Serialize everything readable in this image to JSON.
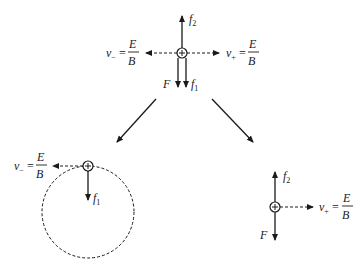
{
  "diagram": {
    "colors": {
      "stroke": "#1a1a1a",
      "background": "#ffffff"
    },
    "top": {
      "particle": {
        "symbol": "+",
        "x": 182,
        "y": 53
      },
      "labels": {
        "f2": "f",
        "f2_sub": "2",
        "f1": "f",
        "f1_sub": "1",
        "F": "F",
        "v_minus": "v",
        "v_minus_sub": "−",
        "v_plus": "v",
        "v_plus_sub": "+",
        "eq": "=",
        "num": "E",
        "den": "B"
      }
    },
    "bottom_left": {
      "particle": {
        "symbol": "+",
        "x": 88,
        "y": 166
      },
      "trajectory": "dashed circle",
      "labels": {
        "f1": "f",
        "f1_sub": "1",
        "v_minus": "v",
        "v_minus_sub": "−",
        "eq": "=",
        "num": "E",
        "den": "B"
      }
    },
    "bottom_right": {
      "particle": {
        "symbol": "+",
        "x": 275,
        "y": 207
      },
      "labels": {
        "f2": "f",
        "f2_sub": "2",
        "F": "F",
        "v_plus": "v",
        "v_plus_sub": "+",
        "eq": "=",
        "num": "E",
        "den": "B"
      }
    }
  }
}
